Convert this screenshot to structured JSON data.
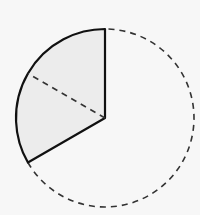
{
  "diagram": {
    "type": "circle-sector",
    "center": [
      105,
      118
    ],
    "radius": 89,
    "sector_start_deg": 90,
    "sector_end_deg": 210,
    "bisector_deg": 150,
    "sector_fill": "#ececec",
    "stroke_color": "#111111",
    "dashed_color": "#333333",
    "background": "#f7f7f7"
  }
}
